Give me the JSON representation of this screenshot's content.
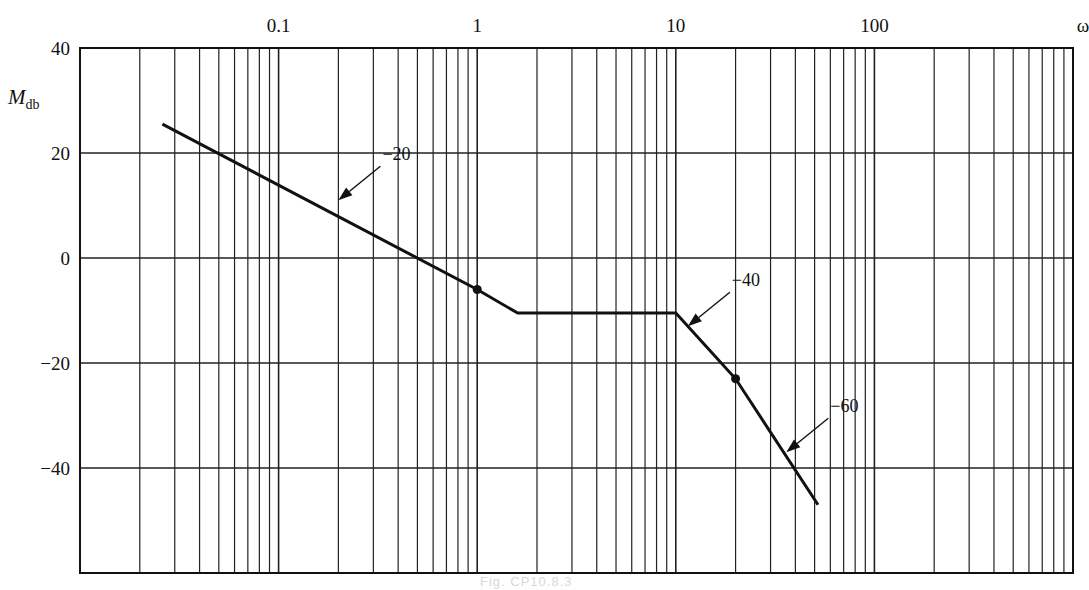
{
  "chart_data": {
    "type": "line",
    "title": "",
    "xlabel": "ω",
    "ylabel": "M_db",
    "ylabel_main": "M",
    "ylabel_sub": "db",
    "xscale": "log",
    "xlim": [
      0.01,
      1000
    ],
    "ylim": [
      -60,
      40
    ],
    "grid": true,
    "x_tick_labels": [
      "0.1",
      "1",
      "10",
      "100"
    ],
    "x_tick_values": [
      0.1,
      1,
      10,
      100
    ],
    "y_tick_labels": [
      "40",
      "20",
      "0",
      "−20",
      "−40"
    ],
    "y_tick_values": [
      40,
      20,
      0,
      -20,
      -40
    ],
    "series": [
      {
        "name": "Asymptotic magnitude",
        "x": [
          0.026,
          1,
          1.6,
          10,
          20,
          52
        ],
        "y": [
          25.5,
          -6,
          -10.5,
          -10.5,
          -23,
          -47
        ]
      }
    ],
    "marked_points": [
      {
        "x": 1,
        "y": -6
      },
      {
        "x": 20,
        "y": -23
      }
    ],
    "annotations": [
      {
        "text": "−20",
        "meaning": "slope dB/decade",
        "points_to": {
          "x": 0.2,
          "y": 11
        }
      },
      {
        "text": "−40",
        "meaning": "slope dB/decade",
        "points_to": {
          "x": 11.5,
          "y": -13
        }
      },
      {
        "text": "−60",
        "meaning": "slope dB/decade",
        "points_to": {
          "x": 36,
          "y": -37
        }
      }
    ],
    "legend": null
  },
  "caption": "Fig. CP10.8.3"
}
